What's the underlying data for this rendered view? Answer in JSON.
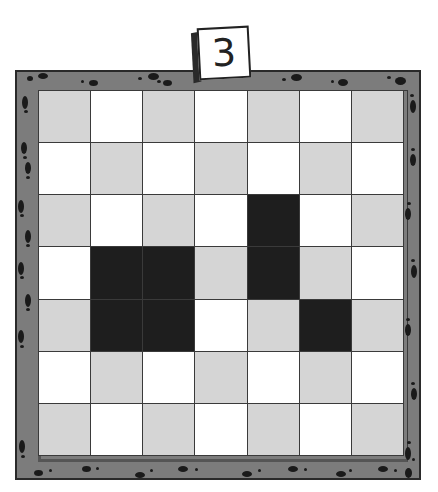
{
  "level_card": {
    "number": "3"
  },
  "board": {
    "rows": 7,
    "cols": 7,
    "colors": {
      "frame": "#7c7c7c",
      "frame_border": "#2a2a2a",
      "cell_light": "#ffffff",
      "cell_gray": "#d5d5d5",
      "cell_dark": "#1e1e1e",
      "grid_line": "#3a3a3a"
    },
    "cells": [
      [
        "gray",
        "white",
        "gray",
        "white",
        "gray",
        "white",
        "gray"
      ],
      [
        "white",
        "gray",
        "white",
        "gray",
        "white",
        "gray",
        "white"
      ],
      [
        "gray",
        "white",
        "gray",
        "white",
        "dark",
        "white",
        "gray"
      ],
      [
        "white",
        "dark",
        "dark",
        "gray",
        "dark",
        "gray",
        "white"
      ],
      [
        "gray",
        "dark",
        "dark",
        "white",
        "gray",
        "dark",
        "gray"
      ],
      [
        "white",
        "gray",
        "white",
        "gray",
        "white",
        "gray",
        "white"
      ],
      [
        "gray",
        "white",
        "gray",
        "white",
        "gray",
        "white",
        "gray"
      ]
    ],
    "dark_cells": [
      [
        2,
        4
      ],
      [
        3,
        1
      ],
      [
        3,
        2
      ],
      [
        3,
        4
      ],
      [
        4,
        1
      ],
      [
        4,
        2
      ],
      [
        4,
        5
      ]
    ]
  }
}
